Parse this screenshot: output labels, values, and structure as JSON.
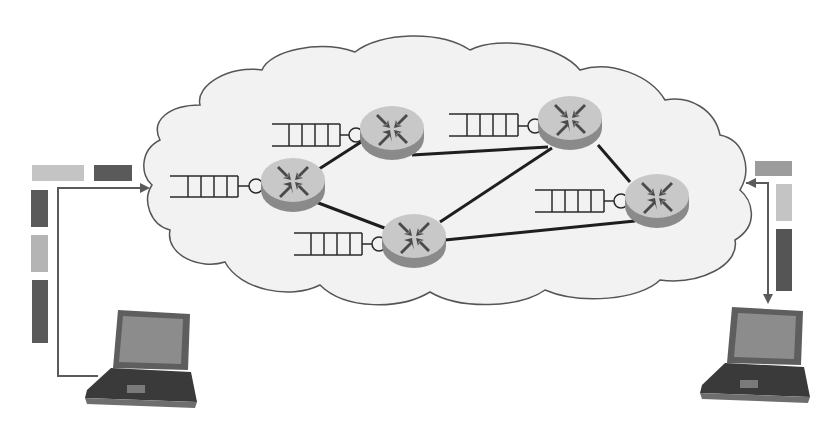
{
  "diagram": {
    "colors": {
      "background": "#ffffff",
      "cloud_fill": "#f2f2f2",
      "cloud_stroke": "#555555",
      "router_top": "#c8c8c8",
      "router_side": "#8a8a8a",
      "router_arrow": "#4a4a4a",
      "link": "#1e1e1e",
      "queue": "#2a2a2a",
      "arrow": "#5a5a5a",
      "packet_light": "#c4c4c4",
      "packet_medium": "#9c9c9c",
      "packet_dark": "#5a5a5a",
      "laptop_body": "#6e6e6e",
      "laptop_screen": "#8a8a8a",
      "laptop_keyboard": "#3a3a3a"
    },
    "routers": [
      {
        "id": "r1",
        "cx": 291,
        "cy": 182
      },
      {
        "id": "r2",
        "cx": 392,
        "cy": 131
      },
      {
        "id": "r3",
        "cx": 566,
        "cy": 118
      },
      {
        "id": "r4",
        "cx": 414,
        "cy": 238
      },
      {
        "id": "r5",
        "cx": 656,
        "cy": 199
      }
    ],
    "links": [
      [
        "r1",
        "r2"
      ],
      [
        "r1",
        "r4"
      ],
      [
        "r2",
        "r3"
      ],
      [
        "r3",
        "r4"
      ],
      [
        "r3",
        "r5"
      ],
      [
        "r4",
        "r5"
      ]
    ],
    "queues": [
      {
        "router": "r1",
        "x": 170,
        "y": 174,
        "slots": 5
      },
      {
        "router": "r2",
        "x": 271,
        "y": 123,
        "slots": 5
      },
      {
        "router": "r3",
        "x": 449,
        "y": 114,
        "slots": 5
      },
      {
        "router": "r4",
        "x": 293,
        "y": 232,
        "slots": 5
      },
      {
        "router": "r5",
        "x": 535,
        "y": 194,
        "slots": 5
      }
    ],
    "hosts": [
      {
        "id": "left-laptop",
        "label": "sending host",
        "x": 85,
        "y": 308
      },
      {
        "id": "right-laptop",
        "label": "receiving host",
        "x": 700,
        "y": 308
      }
    ],
    "packets_left": [
      {
        "x": 32,
        "y": 165,
        "w": 52,
        "h": 16,
        "shade": "packet_light"
      },
      {
        "x": 94,
        "y": 165,
        "w": 38,
        "h": 16,
        "shade": "packet_dark"
      },
      {
        "x": 31,
        "y": 190,
        "w": 17,
        "h": 37,
        "shade": "packet_dark"
      },
      {
        "x": 31,
        "y": 235,
        "w": 17,
        "h": 37,
        "shade": "packet_light"
      },
      {
        "x": 32,
        "y": 280,
        "w": 16,
        "h": 63,
        "shade": "packet_dark"
      }
    ],
    "packets_right": [
      {
        "x": 755,
        "y": 161,
        "w": 37,
        "h": 15,
        "shade": "packet_medium"
      },
      {
        "x": 776,
        "y": 184,
        "w": 16,
        "h": 37,
        "shade": "packet_light"
      },
      {
        "x": 776,
        "y": 229,
        "w": 16,
        "h": 62,
        "shade": "packet_dark"
      }
    ]
  }
}
